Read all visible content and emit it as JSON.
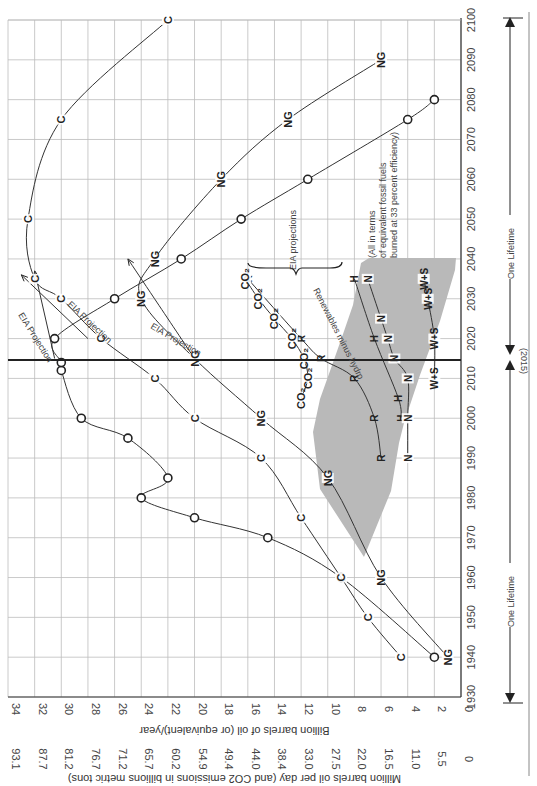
{
  "chart_data": {
    "type": "line",
    "orientation": "rotated-90-clockwise",
    "title": "",
    "xlabel": "Year",
    "ylabel": "Billion barrels of oil (or equivalent)/year",
    "ylabel_secondary": "Million barrels oil per day (and CO2 emissions in billions metric tons)",
    "xlim": [
      1930,
      2100
    ],
    "ylim": [
      0,
      34
    ],
    "x_ticks": [
      1930,
      1940,
      1950,
      1960,
      1970,
      1980,
      1990,
      2000,
      2010,
      2020,
      2030,
      2040,
      2050,
      2060,
      2070,
      2080,
      2090,
      2100
    ],
    "y_ticks": [
      0,
      2,
      4,
      6,
      8,
      10,
      12,
      14,
      16,
      18,
      20,
      22,
      24,
      26,
      28,
      30,
      32,
      34
    ],
    "y_ticks_secondary": [
      "0",
      "5.5",
      "11.0",
      "16.5",
      "22.0",
      "27.5",
      "33.0",
      "38.4",
      "44.0",
      "49.4",
      "54.9",
      "60.2",
      "65.7",
      "71.2",
      "76.7",
      "81.2",
      "87.7",
      "93.1"
    ],
    "grid": true,
    "reference_line": {
      "year": 2015,
      "label": "(2015)"
    },
    "series": [
      {
        "name": "O",
        "label": "Oil",
        "x": [
          1940,
          1960,
          1970,
          1975,
          1980,
          1985,
          1995,
          2000,
          2012,
          2014,
          2020,
          2030,
          2040,
          2050,
          2060,
          2075,
          2080
        ],
        "values": [
          2,
          9,
          14.5,
          20,
          24,
          22,
          25,
          28.5,
          30,
          30,
          30.5,
          26,
          21,
          16.5,
          11.5,
          4,
          2
        ]
      },
      {
        "name": "O-EIA",
        "label": "Oil EIA Projection",
        "x": [
          2015,
          2037
        ],
        "values": [
          30.5,
          32
        ]
      },
      {
        "name": "C",
        "label": "Coal",
        "x": [
          1940,
          1950,
          1960,
          1975,
          1990,
          2000,
          2010,
          2020,
          2030,
          2035,
          2050,
          2075,
          2100
        ],
        "values": [
          4.5,
          7,
          9,
          12,
          15,
          20,
          23,
          27,
          30,
          32,
          32.5,
          30,
          22
        ]
      },
      {
        "name": "C-EIA",
        "label": "Coal EIA Projection",
        "x": [
          2020,
          2036
        ],
        "values": [
          28,
          33
        ]
      },
      {
        "name": "NG",
        "label": "Natural Gas",
        "x": [
          1940,
          1960,
          1985,
          2000,
          2015,
          2030,
          2040,
          2060,
          2075,
          2090
        ],
        "values": [
          1,
          6,
          10,
          15,
          20,
          24,
          23,
          18,
          13,
          6
        ]
      },
      {
        "name": "NG-EIA",
        "label": "Natural Gas EIA Projection",
        "x": [
          2015,
          2030,
          2040
        ],
        "values": [
          20,
          23,
          25
        ]
      },
      {
        "name": "R",
        "label": "Renewables minus hydro",
        "x": [
          1990,
          2000,
          2010,
          2015,
          2020,
          2035
        ],
        "values": [
          6,
          6.5,
          8,
          10.5,
          12,
          16
        ]
      },
      {
        "name": "H",
        "label": "Hydro",
        "x": [
          2000,
          2005,
          2020,
          2035
        ],
        "values": [
          4.5,
          4.7,
          6.5,
          8
        ]
      },
      {
        "name": "N",
        "label": "Nuclear",
        "x": [
          1990,
          2000,
          2010,
          2015,
          2020,
          2025,
          2035
        ],
        "values": [
          4,
          4,
          4,
          5,
          5.5,
          6,
          7
        ]
      },
      {
        "name": "W+S",
        "label": "Wind + Solar",
        "x": [
          2010,
          2020,
          2030,
          2035
        ],
        "values": [
          2,
          2,
          2.5,
          2.8
        ]
      },
      {
        "name": "CO2",
        "label": "CO2 emissions",
        "x": [
          2005,
          2010,
          2015,
          2020,
          2025,
          2030,
          2035
        ],
        "values": [
          12,
          11.5,
          11.8,
          12.7,
          14,
          15.2,
          16.2
        ]
      }
    ],
    "annotations": [
      "EIA projections",
      "EIA Projection",
      "Renewables minus hydro",
      "(All in terms of equivalent fossil fuels burned at 33 percent efficiency)",
      "One Lifetime",
      "(2015)"
    ],
    "legend_position": "none (inline labels)"
  },
  "labels": {
    "y_axis_title": "Billion barrels of oil (or equivalent)/year",
    "y2_axis_title": "Million barrels oil per day (and CO2 emissions in billions metric tons)",
    "eia_projections": "EIA projections",
    "eia_projection": "EIA Projection",
    "renewables_minus_hydro": "Renewables minus hydro",
    "note_line1": "(All in terms",
    "note_line2": "of equivalent fossil fuels",
    "note_line3": "burned at 33 percent efficiency)",
    "one_lifetime": "One Lifetime",
    "ref_year": "(2015)",
    "series_o": "O",
    "series_c": "C",
    "series_ng": "NG",
    "series_r": "R",
    "series_h": "H",
    "series_n": "N",
    "series_ws": "W+S",
    "series_co2": "CO2"
  }
}
